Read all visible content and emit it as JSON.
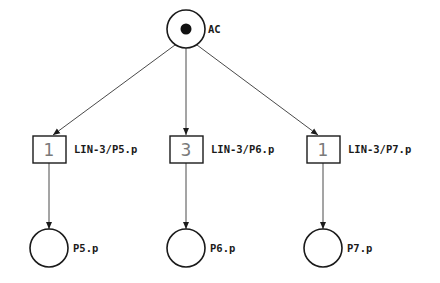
{
  "diagram": {
    "type": "petri-net",
    "colors": {
      "stroke": "#1a1a1a",
      "arc": "#4a4a4a",
      "token_count": "#7a7a7a",
      "background": "#ffffff"
    },
    "places": [
      {
        "id": "AC",
        "label": "AC",
        "cx": 186,
        "cy": 29,
        "r": 19,
        "marked": true
      },
      {
        "id": "P5",
        "label": "P5.p",
        "cx": 49,
        "cy": 248,
        "r": 19,
        "marked": false
      },
      {
        "id": "P6",
        "label": "P6.p",
        "cx": 186,
        "cy": 248,
        "r": 19,
        "marked": false
      },
      {
        "id": "P7",
        "label": "P7.p",
        "cx": 323,
        "cy": 248,
        "r": 19,
        "marked": false
      }
    ],
    "transitions": [
      {
        "id": "T5",
        "label": "LIN-3/P5.p",
        "count": "1",
        "cx": 49,
        "cy": 149,
        "w": 33,
        "h": 27
      },
      {
        "id": "T6",
        "label": "LIN-3/P6.p",
        "count": "3",
        "cx": 186,
        "cy": 149,
        "w": 33,
        "h": 27
      },
      {
        "id": "T7",
        "label": "LIN-3/P7.p",
        "count": "1",
        "cx": 323,
        "cy": 149,
        "w": 33,
        "h": 27
      }
    ],
    "arcs": [
      {
        "from": "AC",
        "to": "T5"
      },
      {
        "from": "AC",
        "to": "T6"
      },
      {
        "from": "AC",
        "to": "T7"
      },
      {
        "from": "T5",
        "to": "P5"
      },
      {
        "from": "T6",
        "to": "P6"
      },
      {
        "from": "T7",
        "to": "P7"
      }
    ]
  }
}
